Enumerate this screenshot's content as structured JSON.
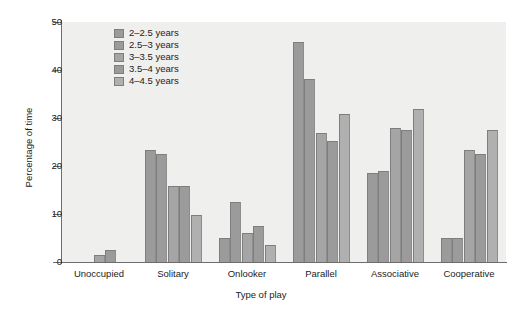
{
  "chart_data": {
    "type": "bar",
    "title": "",
    "xlabel": "Type of play",
    "ylabel": "Percentage of time",
    "ylim": [
      0,
      50
    ],
    "yticks": [
      0,
      10,
      20,
      30,
      40,
      50
    ],
    "grid": false,
    "legend_position": "top-left-inside",
    "categories": [
      "Unoccupied",
      "Solitary",
      "Onlooker",
      "Parallel",
      "Associative",
      "Cooperative"
    ],
    "series": [
      {
        "name": "2–2.5 years",
        "color": "#9b9b9b",
        "values": [
          0,
          23.3,
          5.0,
          45.8,
          18.5,
          5.0
        ]
      },
      {
        "name": "2.5–3 years",
        "color": "#9b9b9b",
        "values": [
          0,
          22.5,
          12.5,
          38.2,
          19.0,
          5.0
        ]
      },
      {
        "name": "3–3.5 years",
        "color": "#a5a5a5",
        "values": [
          1.5,
          15.8,
          6.0,
          26.8,
          28.0,
          23.3
        ]
      },
      {
        "name": "3.5–4 years",
        "color": "#9b9b9b",
        "values": [
          2.4,
          15.8,
          7.4,
          25.3,
          27.5,
          22.4
        ]
      },
      {
        "name": "4–4.5 years",
        "color": "#b0b0b0",
        "values": [
          0,
          9.8,
          3.5,
          30.8,
          31.8,
          27.4
        ]
      }
    ]
  },
  "axes": {
    "y_title": "Percentage of time",
    "x_title": "Type of play",
    "y_tick_labels": [
      "0",
      "10",
      "20",
      "30",
      "40",
      "50"
    ],
    "x_tick_labels": [
      "Unoccupied",
      "Solitary",
      "Onlooker",
      "Parallel",
      "Associative",
      "Cooperative"
    ]
  },
  "legend": {
    "items": [
      {
        "label": "2–2.5 years"
      },
      {
        "label": "2.5–3 years"
      },
      {
        "label": "3–3.5 years"
      },
      {
        "label": "3.5–4 years"
      },
      {
        "label": "4–4.5 years"
      }
    ]
  },
  "colors": {
    "plot_background": "#efefed",
    "axis": "#6d6d6d",
    "text": "#1c1c1c",
    "bar_default": "#9b9b9b",
    "bar_edge": "#7e7e7e"
  }
}
